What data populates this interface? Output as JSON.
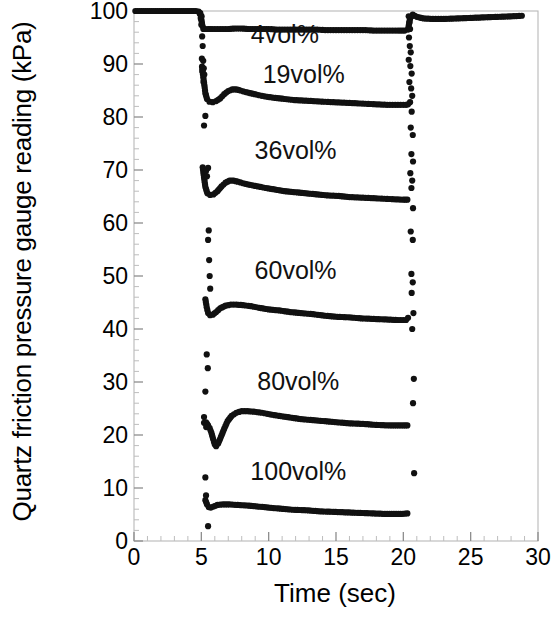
{
  "chart_data": {
    "type": "scatter",
    "title": "",
    "xlabel": "Time (sec)",
    "ylabel": "Quartz friction pressure gauge reading (kPa)",
    "xlim": [
      0,
      30
    ],
    "ylim": [
      0,
      100
    ],
    "xticks": [
      0,
      5,
      10,
      15,
      20,
      25,
      30
    ],
    "yticks": [
      0,
      10,
      20,
      30,
      40,
      50,
      60,
      70,
      80,
      90,
      100
    ],
    "x_minor_tick_interval": 1,
    "y_minor_tick_interval": 2,
    "grid": false,
    "legend_position": "inline-annotations",
    "marker": "filled-circle",
    "marker_color": "#111111",
    "baseline_value": 100,
    "event_start_time": 4.9,
    "event_end_time": 20.4,
    "annotations": [
      {
        "label": "4vol%",
        "x": 11.2,
        "y": 94.0
      },
      {
        "label": "19vol%",
        "x": 12.6,
        "y": 86.5
      },
      {
        "label": "36vol%",
        "x": 12.0,
        "y": 72.0
      },
      {
        "label": "60vol%",
        "x": 12.0,
        "y": 49.5
      },
      {
        "label": "80vol%",
        "x": 12.2,
        "y": 28.5
      },
      {
        "label": "100vol%",
        "x": 12.2,
        "y": 11.5
      }
    ],
    "series": [
      {
        "name": "4vol%",
        "plateau_value": 96.5,
        "points": [
          [
            0.1,
            100
          ],
          [
            0.4,
            100
          ],
          [
            0.7,
            100
          ],
          [
            1.0,
            100
          ],
          [
            1.3,
            100
          ],
          [
            1.6,
            100
          ],
          [
            1.9,
            100
          ],
          [
            2.2,
            100
          ],
          [
            2.5,
            100
          ],
          [
            2.8,
            100
          ],
          [
            3.1,
            100
          ],
          [
            3.4,
            100
          ],
          [
            3.7,
            100
          ],
          [
            4.0,
            100
          ],
          [
            4.3,
            100
          ],
          [
            4.6,
            100
          ],
          [
            4.8,
            99.9
          ],
          [
            4.95,
            99.2
          ],
          [
            5.05,
            97.6
          ],
          [
            5.15,
            96.6
          ],
          [
            5.3,
            96.6
          ],
          [
            5.5,
            96.6
          ],
          [
            5.8,
            96.6
          ],
          [
            6.2,
            96.6
          ],
          [
            6.6,
            96.6
          ],
          [
            7.0,
            96.6
          ],
          [
            7.5,
            96.7
          ],
          [
            8.0,
            96.7
          ],
          [
            8.5,
            96.6
          ],
          [
            9.0,
            96.6
          ],
          [
            9.5,
            96.6
          ],
          [
            10.0,
            96.6
          ],
          [
            10.6,
            96.5
          ],
          [
            11.2,
            96.5
          ],
          [
            11.8,
            96.5
          ],
          [
            12.4,
            96.5
          ],
          [
            13.0,
            96.5
          ],
          [
            13.6,
            96.5
          ],
          [
            14.2,
            96.4
          ],
          [
            14.8,
            96.4
          ],
          [
            15.4,
            96.4
          ],
          [
            16.0,
            96.4
          ],
          [
            16.6,
            96.4
          ],
          [
            17.2,
            96.4
          ],
          [
            17.8,
            96.3
          ],
          [
            18.4,
            96.3
          ],
          [
            19.0,
            96.3
          ],
          [
            19.6,
            96.3
          ],
          [
            20.1,
            96.3
          ],
          [
            20.35,
            96.5
          ],
          [
            20.5,
            98.6
          ],
          [
            20.7,
            99.3
          ],
          [
            21.0,
            98.9
          ],
          [
            21.5,
            98.6
          ],
          [
            22.2,
            98.5
          ],
          [
            23.0,
            98.5
          ],
          [
            24.0,
            98.6
          ],
          [
            25.0,
            98.7
          ],
          [
            26.0,
            98.8
          ],
          [
            27.0,
            98.9
          ],
          [
            28.0,
            99.0
          ],
          [
            28.8,
            99.1
          ]
        ]
      },
      {
        "name": "19vol%",
        "dip_value": 82.8,
        "peak_value": 85.2,
        "plateau_value": 82.2,
        "points": [
          [
            5.05,
            89.5
          ],
          [
            5.12,
            88.0
          ],
          [
            5.2,
            86.5
          ],
          [
            5.3,
            84.5
          ],
          [
            5.42,
            83.4
          ],
          [
            5.6,
            82.9
          ],
          [
            5.85,
            82.8
          ],
          [
            6.1,
            83.0
          ],
          [
            6.4,
            83.5
          ],
          [
            6.7,
            84.3
          ],
          [
            7.0,
            84.9
          ],
          [
            7.3,
            85.2
          ],
          [
            7.6,
            85.2
          ],
          [
            7.9,
            85.0
          ],
          [
            8.3,
            84.7
          ],
          [
            8.8,
            84.4
          ],
          [
            9.3,
            84.1
          ],
          [
            9.9,
            83.8
          ],
          [
            10.5,
            83.6
          ],
          [
            11.2,
            83.4
          ],
          [
            11.9,
            83.2
          ],
          [
            12.6,
            83.1
          ],
          [
            13.3,
            83.0
          ],
          [
            14.0,
            82.9
          ],
          [
            14.8,
            82.8
          ],
          [
            15.6,
            82.7
          ],
          [
            16.4,
            82.6
          ],
          [
            17.2,
            82.5
          ],
          [
            18.0,
            82.4
          ],
          [
            18.8,
            82.3
          ],
          [
            19.6,
            82.3
          ],
          [
            20.2,
            82.3
          ],
          [
            20.35,
            82.4
          ]
        ]
      },
      {
        "name": "36vol%",
        "dip_value": 65.3,
        "peak_value": 68.0,
        "plateau_value": 64.4,
        "points": [
          [
            5.1,
            70.5
          ],
          [
            5.2,
            68.6
          ],
          [
            5.3,
            66.8
          ],
          [
            5.45,
            65.6
          ],
          [
            5.65,
            65.3
          ],
          [
            5.9,
            65.4
          ],
          [
            6.2,
            66.0
          ],
          [
            6.5,
            66.9
          ],
          [
            6.8,
            67.6
          ],
          [
            7.1,
            68.0
          ],
          [
            7.4,
            68.0
          ],
          [
            7.7,
            67.8
          ],
          [
            8.1,
            67.5
          ],
          [
            8.6,
            67.2
          ],
          [
            9.2,
            66.9
          ],
          [
            9.8,
            66.6
          ],
          [
            10.5,
            66.3
          ],
          [
            11.2,
            66.0
          ],
          [
            12.0,
            65.8
          ],
          [
            12.8,
            65.6
          ],
          [
            13.6,
            65.4
          ],
          [
            14.4,
            65.2
          ],
          [
            15.2,
            65.1
          ],
          [
            16.0,
            64.9
          ],
          [
            16.8,
            64.8
          ],
          [
            17.6,
            64.7
          ],
          [
            18.4,
            64.6
          ],
          [
            19.2,
            64.5
          ],
          [
            20.0,
            64.4
          ],
          [
            20.3,
            64.4
          ]
        ]
      },
      {
        "name": "60vol%",
        "dip_value": 42.6,
        "peak_value": 44.6,
        "plateau_value": 41.7,
        "points": [
          [
            5.3,
            45.6
          ],
          [
            5.4,
            44.1
          ],
          [
            5.5,
            43.0
          ],
          [
            5.65,
            42.6
          ],
          [
            5.85,
            42.7
          ],
          [
            6.1,
            43.2
          ],
          [
            6.4,
            43.9
          ],
          [
            6.8,
            44.4
          ],
          [
            7.2,
            44.6
          ],
          [
            7.6,
            44.6
          ],
          [
            8.1,
            44.5
          ],
          [
            8.7,
            44.3
          ],
          [
            9.3,
            44.0
          ],
          [
            10.0,
            43.7
          ],
          [
            10.8,
            43.5
          ],
          [
            11.6,
            43.2
          ],
          [
            12.4,
            43.0
          ],
          [
            13.3,
            42.8
          ],
          [
            14.2,
            42.5
          ],
          [
            15.1,
            42.3
          ],
          [
            16.0,
            42.2
          ],
          [
            16.9,
            42.0
          ],
          [
            17.8,
            41.9
          ],
          [
            18.7,
            41.8
          ],
          [
            19.6,
            41.7
          ],
          [
            20.2,
            41.7
          ],
          [
            20.35,
            42.1
          ]
        ]
      },
      {
        "name": "80vol%",
        "dip_value": 17.9,
        "peak_value": 24.5,
        "plateau_value": 21.8,
        "points": [
          [
            5.2,
            22.3
          ],
          [
            5.35,
            22.4
          ],
          [
            5.5,
            21.8
          ],
          [
            5.62,
            21.3
          ],
          [
            5.75,
            20.4
          ],
          [
            5.88,
            19.2
          ],
          [
            6.0,
            18.2
          ],
          [
            6.1,
            17.9
          ],
          [
            6.25,
            18.4
          ],
          [
            6.45,
            19.6
          ],
          [
            6.7,
            21.2
          ],
          [
            6.95,
            22.6
          ],
          [
            7.25,
            23.6
          ],
          [
            7.6,
            24.2
          ],
          [
            8.0,
            24.5
          ],
          [
            8.4,
            24.5
          ],
          [
            8.9,
            24.4
          ],
          [
            9.5,
            24.2
          ],
          [
            10.1,
            23.9
          ],
          [
            10.8,
            23.6
          ],
          [
            11.6,
            23.3
          ],
          [
            12.4,
            23.0
          ],
          [
            13.3,
            22.8
          ],
          [
            14.2,
            22.6
          ],
          [
            15.1,
            22.4
          ],
          [
            16.0,
            22.2
          ],
          [
            17.0,
            22.1
          ],
          [
            18.0,
            21.9
          ],
          [
            19.0,
            21.8
          ],
          [
            20.0,
            21.8
          ],
          [
            20.3,
            21.8
          ]
        ]
      },
      {
        "name": "100vol%",
        "dip_value": 6.3,
        "peak_value": 6.9,
        "plateau_value": 5.0,
        "points": [
          [
            5.3,
            7.7
          ],
          [
            5.42,
            6.9
          ],
          [
            5.55,
            6.4
          ],
          [
            5.7,
            6.3
          ],
          [
            5.9,
            6.5
          ],
          [
            6.2,
            6.8
          ],
          [
            6.6,
            6.9
          ],
          [
            7.1,
            6.9
          ],
          [
            7.7,
            6.8
          ],
          [
            8.4,
            6.7
          ],
          [
            9.2,
            6.5
          ],
          [
            10.0,
            6.3
          ],
          [
            10.9,
            6.1
          ],
          [
            11.8,
            5.9
          ],
          [
            12.8,
            5.8
          ],
          [
            13.8,
            5.6
          ],
          [
            14.8,
            5.5
          ],
          [
            15.8,
            5.4
          ],
          [
            16.8,
            5.3
          ],
          [
            17.8,
            5.2
          ],
          [
            18.8,
            5.1
          ],
          [
            19.8,
            5.1
          ],
          [
            20.3,
            5.2
          ]
        ]
      }
    ],
    "transition_scatter_left": [
      [
        4.92,
        99.6
      ],
      [
        4.96,
        98.6
      ],
      [
        5.0,
        97.4
      ],
      [
        5.02,
        99.0
      ],
      [
        5.06,
        95.2
      ],
      [
        5.1,
        93.4
      ],
      [
        5.04,
        91.0
      ],
      [
        5.14,
        90.6
      ],
      [
        5.18,
        89.2
      ],
      [
        5.08,
        88.6
      ],
      [
        5.22,
        88.0
      ],
      [
        5.16,
        86.6
      ],
      [
        5.3,
        80.2
      ],
      [
        5.2,
        78.4
      ],
      [
        5.5,
        70.4
      ],
      [
        5.35,
        69.8
      ],
      [
        5.42,
        68.8
      ],
      [
        5.55,
        58.6
      ],
      [
        5.5,
        56.8
      ],
      [
        5.58,
        53.0
      ],
      [
        5.62,
        50.0
      ],
      [
        5.66,
        47.6
      ],
      [
        5.4,
        35.2
      ],
      [
        5.48,
        32.6
      ],
      [
        5.3,
        28.2
      ],
      [
        5.2,
        23.4
      ],
      [
        5.36,
        21.5
      ],
      [
        5.3,
        12.0
      ],
      [
        5.35,
        8.6
      ],
      [
        5.5,
        2.8
      ]
    ],
    "transition_scatter_right": [
      [
        20.4,
        99.0
      ],
      [
        20.45,
        97.8
      ],
      [
        20.5,
        96.6
      ],
      [
        20.42,
        95.0
      ],
      [
        20.48,
        93.4
      ],
      [
        20.55,
        92.2
      ],
      [
        20.4,
        90.8
      ],
      [
        20.52,
        89.6
      ],
      [
        20.62,
        88.2
      ],
      [
        20.45,
        86.6
      ],
      [
        20.58,
        85.4
      ],
      [
        20.66,
        84.0
      ],
      [
        20.5,
        82.8
      ],
      [
        20.62,
        81.0
      ],
      [
        20.55,
        78.0
      ],
      [
        20.7,
        76.6
      ],
      [
        20.6,
        73.0
      ],
      [
        20.72,
        71.6
      ],
      [
        20.52,
        69.4
      ],
      [
        20.66,
        68.0
      ],
      [
        20.6,
        66.6
      ],
      [
        20.72,
        62.8
      ],
      [
        20.55,
        58.4
      ],
      [
        20.7,
        56.8
      ],
      [
        20.6,
        50.4
      ],
      [
        20.7,
        48.8
      ],
      [
        20.62,
        46.8
      ],
      [
        20.75,
        43.0
      ],
      [
        20.66,
        40.0
      ],
      [
        20.78,
        30.6
      ],
      [
        20.72,
        26.0
      ],
      [
        20.8,
        12.8
      ]
    ]
  }
}
